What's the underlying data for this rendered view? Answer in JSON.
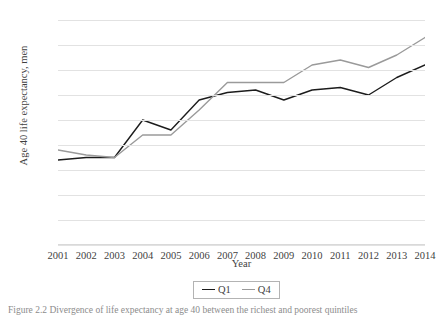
{
  "chart_data": {
    "type": "line",
    "title": "",
    "xlabel": "Year",
    "ylabel": "Age 40 life expectancy, men",
    "categories": [
      2001,
      2002,
      2003,
      2004,
      2005,
      2006,
      2007,
      2008,
      2009,
      2010,
      2011,
      2012,
      2013,
      2014
    ],
    "xticklabels": [
      "2001",
      "2002",
      "2003",
      "2004",
      "2005",
      "2006",
      "2007",
      "2008",
      "2009",
      "2010",
      "2011",
      "2012",
      "2013",
      "2014"
    ],
    "yticklabels": [
      "83",
      "82.5",
      "82",
      "81.5",
      "81",
      "80.5",
      "80",
      "79.5",
      "79",
      "78.5"
    ],
    "ytickvalues": [
      83,
      82.5,
      82,
      81.5,
      81,
      80.5,
      80,
      79.5,
      79,
      78.5
    ],
    "ylim": [
      78.5,
      83
    ],
    "grid": true,
    "legend_position": "bottom-center",
    "series": [
      {
        "name": "Q1",
        "color": "#1c1c1c",
        "values": [
          80.2,
          80.25,
          80.25,
          81.0,
          80.8,
          81.4,
          81.55,
          81.6,
          81.4,
          81.6,
          81.65,
          81.5,
          81.85,
          82.1
        ]
      },
      {
        "name": "Q4",
        "color": "#9a9a9a",
        "values": [
          80.4,
          80.3,
          80.25,
          80.7,
          80.7,
          81.2,
          81.75,
          81.75,
          81.75,
          82.1,
          82.2,
          82.05,
          82.3,
          82.65
        ]
      }
    ]
  },
  "legend": {
    "items": [
      {
        "label": "Q1"
      },
      {
        "label": "Q4"
      }
    ]
  },
  "caption": {
    "text": "Figure 2.2 Divergence of life expectancy at age 40 between the richest and poorest quintiles"
  }
}
